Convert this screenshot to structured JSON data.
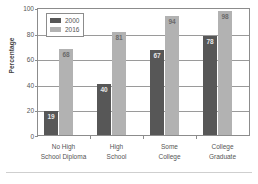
{
  "chart_data": {
    "type": "bar",
    "title": "",
    "xlabel": "",
    "ylabel": "Percentage",
    "ylim": [
      0,
      100
    ],
    "yticks": [
      0,
      20,
      40,
      60,
      80,
      100
    ],
    "grid": true,
    "legend_position": "top-left",
    "categories": [
      {
        "line1": "No High",
        "line2": "School Diploma"
      },
      {
        "line1": "High",
        "line2": "School"
      },
      {
        "line1": "Some",
        "line2": "College"
      },
      {
        "line1": "College",
        "line2": "Graduate"
      }
    ],
    "series": [
      {
        "name": "2000",
        "color": "#575757",
        "values": [
          19,
          40,
          67,
          78
        ]
      },
      {
        "name": "2016",
        "color": "#b2b2b2",
        "values": [
          68,
          81,
          94,
          98
        ]
      }
    ]
  },
  "legend": {
    "entries": [
      {
        "label": "2000"
      },
      {
        "label": "2016"
      }
    ]
  }
}
